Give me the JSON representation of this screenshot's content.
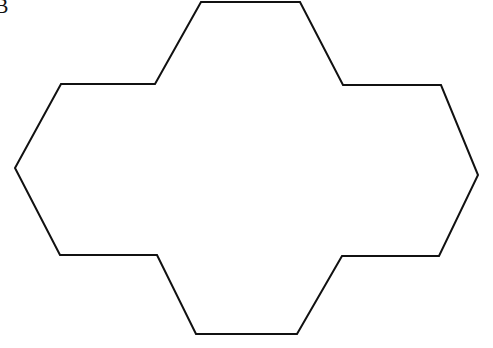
{
  "figure": {
    "label": "B",
    "background_color": "#ffffff",
    "stroke_color": "#111111",
    "fill_color": "#ffffff",
    "stroke_width": 2,
    "width": 493,
    "height": 348,
    "shape_name": "polyhex-outline",
    "shape_description": "Outline of three fused regular hexagons forming a plus/cross-like hexagonal polyform",
    "points": "201,2 300,2 343,85 441,85 478,175 439,256 342,256 297,334 196,334 157,255 60,255 15,168 61,84 155,84",
    "vertices": [
      {
        "x": 201,
        "y": 2
      },
      {
        "x": 300,
        "y": 2
      },
      {
        "x": 343,
        "y": 85
      },
      {
        "x": 441,
        "y": 85
      },
      {
        "x": 478,
        "y": 175
      },
      {
        "x": 439,
        "y": 256
      },
      {
        "x": 342,
        "y": 256
      },
      {
        "x": 297,
        "y": 334
      },
      {
        "x": 196,
        "y": 334
      },
      {
        "x": 157,
        "y": 255
      },
      {
        "x": 60,
        "y": 255
      },
      {
        "x": 15,
        "y": 168
      },
      {
        "x": 61,
        "y": 84
      },
      {
        "x": 155,
        "y": 84
      }
    ]
  }
}
